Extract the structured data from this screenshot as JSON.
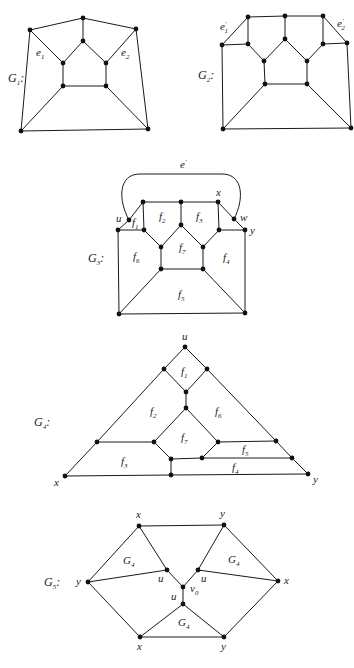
{
  "figure": {
    "graphs": [
      {
        "id": "G1",
        "name_label": "G",
        "name_sub": "1",
        "suffix": ":",
        "edge_labels": [
          {
            "base": "e",
            "sub": "1",
            "sup": ""
          },
          {
            "base": "e",
            "sub": "2",
            "sup": ""
          }
        ]
      },
      {
        "id": "G2",
        "name_label": "G",
        "name_sub": "2",
        "suffix": ":",
        "edge_labels": [
          {
            "base": "e",
            "sub": "1",
            "sup": "'"
          },
          {
            "base": "e",
            "sub": "2",
            "sup": "'"
          }
        ]
      },
      {
        "id": "G3",
        "name_label": "G",
        "name_sub": "3",
        "suffix": ":",
        "edge_labels": [
          {
            "base": "e",
            "sub": "",
            "sup": "'"
          }
        ],
        "vertex_labels": [
          "u",
          "x",
          "w",
          "y"
        ],
        "face_labels": [
          {
            "base": "f",
            "sub": "1"
          },
          {
            "base": "f",
            "sub": "2"
          },
          {
            "base": "f",
            "sub": "3"
          },
          {
            "base": "f",
            "sub": "4"
          },
          {
            "base": "f",
            "sub": "5"
          },
          {
            "base": "f",
            "sub": "6"
          },
          {
            "base": "f",
            "sub": "7"
          }
        ]
      },
      {
        "id": "G4",
        "name_label": "G",
        "name_sub": "4",
        "suffix": ":",
        "vertex_labels": [
          "u",
          "x",
          "y"
        ],
        "face_labels": [
          {
            "base": "f",
            "sub": "1"
          },
          {
            "base": "f",
            "sub": "2"
          },
          {
            "base": "f",
            "sub": "3"
          },
          {
            "base": "f",
            "sub": "4"
          },
          {
            "base": "f",
            "sub": "5"
          },
          {
            "base": "f",
            "sub": "6"
          },
          {
            "base": "f",
            "sub": "7"
          }
        ]
      },
      {
        "id": "G5",
        "name_label": "G",
        "name_sub": "5",
        "suffix": ":",
        "vertex_labels": [
          "x",
          "y",
          "y",
          "x",
          "u",
          "u",
          "v",
          "u",
          "x",
          "y"
        ],
        "v0_sub": "0",
        "region_labels": [
          {
            "base": "G",
            "sub": "4"
          },
          {
            "base": "G",
            "sub": "4"
          },
          {
            "base": "G",
            "sub": "4"
          }
        ]
      }
    ]
  }
}
